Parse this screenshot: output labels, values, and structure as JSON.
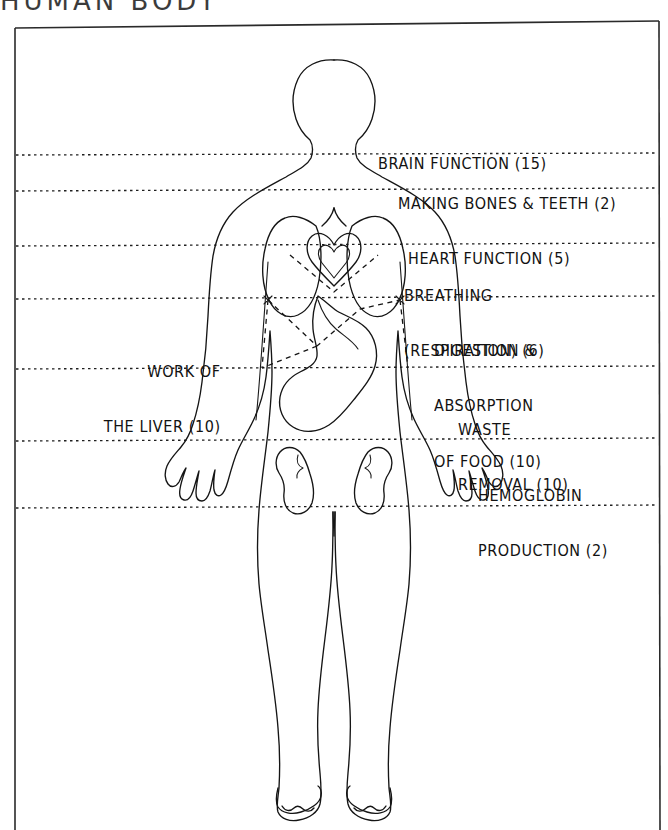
{
  "page": {
    "title_partial": "HUMAN BODY",
    "background_color": "#ffffff",
    "ink_color": "#121212"
  },
  "frame": {
    "name": "diagram-border",
    "left": 14,
    "top": 20,
    "right": 660,
    "bottom": 830
  },
  "diagram": {
    "type": "annotated-anatomy-figure",
    "organs": [
      "brain",
      "lungs",
      "heart",
      "liver",
      "stomach",
      "kidneys"
    ]
  },
  "labels": {
    "right": [
      {
        "id": "brain-function",
        "lines": [
          "BRAIN FUNCTION (15)"
        ],
        "value": 15,
        "x": 378,
        "y": 118
      },
      {
        "id": "making-bones-teeth",
        "lines": [
          "MAKING BONES & TEETH (2)"
        ],
        "value": 2,
        "x": 398,
        "y": 158
      },
      {
        "id": "heart-function",
        "lines": [
          "HEART FUNCTION (5)"
        ],
        "value": 5,
        "x": 408,
        "y": 213
      },
      {
        "id": "breathing-respiration",
        "lines": [
          "BREATHING",
          "(RESPIRATION) (6)"
        ],
        "value": 6,
        "x": 404,
        "y": 250
      },
      {
        "id": "digestion-absorption-of-food",
        "lines": [
          "DIGESTION &",
          "ABSORPTION",
          "OF FOOD (10)"
        ],
        "value": 10,
        "x": 434,
        "y": 305
      },
      {
        "id": "waste-removal",
        "lines": [
          "WASTE",
          "REMOVAL (10)"
        ],
        "value": 10,
        "x": 458,
        "y": 384
      },
      {
        "id": "hemoglobin-production",
        "lines": [
          "HEMOGLOBIN",
          "PRODUCTION (2)"
        ],
        "value": 2,
        "x": 478,
        "y": 450
      }
    ],
    "left": [
      {
        "id": "work-of-the-liver",
        "lines": [
          "WORK OF",
          "THE LIVER (10)"
        ],
        "value": 10,
        "x": 86,
        "y": 326
      }
    ]
  },
  "divider_lines": {
    "style": "dotted",
    "y_positions": [
      155,
      190,
      245,
      298,
      368,
      440,
      507
    ]
  }
}
